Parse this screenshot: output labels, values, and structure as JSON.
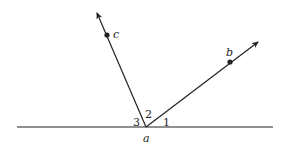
{
  "diagram": {
    "type": "geometry-angles",
    "vertex": {
      "label": "a",
      "x": 146,
      "y": 127
    },
    "baseline": {
      "x1": 17,
      "y1": 127,
      "x2": 273,
      "y2": 127
    },
    "rays": [
      {
        "name": "ray-ac",
        "to_x": 97,
        "to_y": 12,
        "point": {
          "label": "c",
          "x": 107,
          "y": 35
        }
      },
      {
        "name": "ray-ab",
        "to_x": 259,
        "to_y": 41,
        "point": {
          "label": "b",
          "x": 230,
          "y": 62
        }
      }
    ],
    "angle_labels": [
      {
        "label": "3",
        "x": 136,
        "y": 127
      },
      {
        "label": "2",
        "x": 148,
        "y": 119
      },
      {
        "label": "1",
        "x": 164,
        "y": 127
      }
    ],
    "colors": {
      "stroke": "#222222",
      "background": "#ffffff"
    }
  }
}
